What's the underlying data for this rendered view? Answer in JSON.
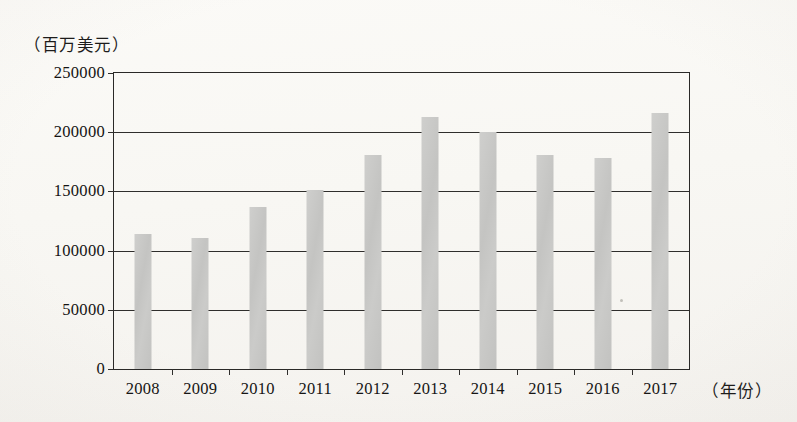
{
  "chart_data": {
    "type": "bar",
    "title": "",
    "subtitle": "",
    "xlabel": "（年份）",
    "ylabel": "（百万美元）",
    "categories": [
      "2008",
      "2009",
      "2010",
      "2011",
      "2012",
      "2013",
      "2014",
      "2015",
      "2016",
      "2017"
    ],
    "values": [
      114000,
      111000,
      137000,
      151000,
      181000,
      213000,
      200000,
      181000,
      178000,
      216000
    ],
    "ylim": [
      0,
      250000
    ],
    "ytick_labels": [
      "0",
      "50000",
      "100000",
      "150000",
      "200000",
      "250000"
    ],
    "ytick_values": [
      0,
      50000,
      100000,
      150000,
      200000,
      250000
    ],
    "grid": true,
    "grid_axis": "y",
    "legend": false,
    "legend_position": "none",
    "bar_color": "#c6c6c4",
    "axis_color": "#2a2927",
    "background_color": "#fbfaf7"
  }
}
